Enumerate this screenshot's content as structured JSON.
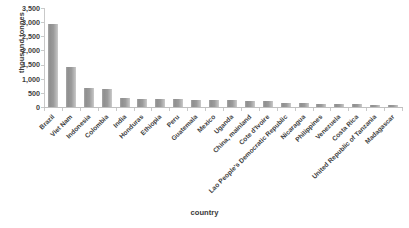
{
  "chart_data": {
    "type": "bar",
    "title": "",
    "xlabel": "country",
    "ylabel": "thousand tonnes",
    "ylim": [
      0,
      3500
    ],
    "ytick_labels": [
      "3,500",
      "3,000",
      "2,500",
      "2,000",
      "1,500",
      "1,000",
      "500",
      "0"
    ],
    "ytick_values": [
      3500,
      3000,
      2500,
      2000,
      1500,
      1000,
      500,
      0
    ],
    "grid": false,
    "legend": null,
    "bar_color": "#9b9b9b",
    "categories": [
      "Brazil",
      "Viet Nam",
      "Indonesia",
      "Colombia",
      "India",
      "Honduras",
      "Ethiopia",
      "Peru",
      "Guatemala",
      "Mexico",
      "Uganda",
      "China, mainland",
      "Cote d'Ivoire",
      "Lao People's Democratic Republic",
      "Nicaragua",
      "Philippines",
      "Venezuela",
      "Costa Rica",
      "United Republic of Tanzania",
      "Madagascar"
    ],
    "values": [
      2950,
      1430,
      670,
      650,
      320,
      300,
      290,
      280,
      255,
      245,
      240,
      230,
      200,
      145,
      130,
      120,
      95,
      90,
      75,
      60
    ]
  }
}
